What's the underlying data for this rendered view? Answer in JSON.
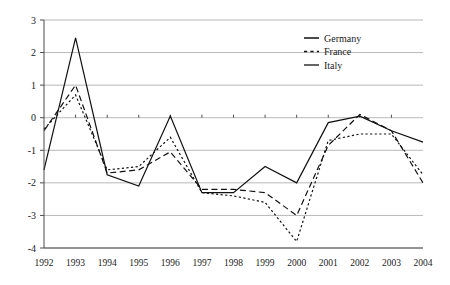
{
  "chart_data": {
    "type": "line",
    "title": "",
    "subtitle": "",
    "xlabel": "",
    "ylabel": "",
    "categories": [
      "1992",
      "1993",
      "1994",
      "1995",
      "1996",
      "1997",
      "1998",
      "1999",
      "2000",
      "2001",
      "2002",
      "2003",
      "2004"
    ],
    "x": [
      1992,
      1993,
      1994,
      1995,
      1996,
      1997,
      1998,
      1999,
      2000,
      2001,
      2002,
      2003,
      2004
    ],
    "xlim": [
      1992,
      2004
    ],
    "ylim": [
      -4,
      3
    ],
    "yticks": [
      3,
      2,
      1,
      0,
      -1,
      -2,
      -3,
      -4
    ],
    "ytick_labels": [
      "3",
      "2",
      "1",
      "0",
      "-1",
      "-2",
      "-3",
      "-4"
    ],
    "grid": true,
    "grid_axis": "y",
    "legend_position": "top-right",
    "series": [
      {
        "name": "Germany",
        "style": "dashed",
        "color": "#111111",
        "values": [
          -0.4,
          1.0,
          -1.7,
          -1.6,
          -1.05,
          -2.2,
          -2.2,
          -2.3,
          -3.0,
          -0.85,
          0.1,
          -0.4,
          -2.0
        ]
      },
      {
        "name": "France",
        "style": "dotted",
        "color": "#111111",
        "values": [
          -0.35,
          0.7,
          -1.6,
          -1.5,
          -0.6,
          -2.3,
          -2.4,
          -2.6,
          -3.8,
          -0.7,
          -0.5,
          -0.5,
          -1.75
        ]
      },
      {
        "name": "Italy",
        "style": "solid",
        "color": "#111111",
        "values": [
          -1.6,
          2.45,
          -1.75,
          -2.1,
          0.05,
          -2.3,
          -2.3,
          -1.5,
          -2.0,
          -0.15,
          0.05,
          -0.4,
          -0.75
        ]
      }
    ]
  },
  "legend": {
    "entries": [
      {
        "label": "Germany",
        "style": "dashed"
      },
      {
        "label": "France",
        "style": "dotted"
      },
      {
        "label": "Italy",
        "style": "solid"
      }
    ]
  },
  "axes": {
    "y_tick_labels": [
      "3",
      "2",
      "1",
      "0",
      "-1",
      "-2",
      "-3",
      "-4"
    ],
    "x_tick_labels": [
      "1992",
      "1993",
      "1994",
      "1995",
      "1996",
      "1997",
      "1998",
      "1999",
      "2000",
      "2001",
      "2002",
      "2003",
      "2004"
    ]
  },
  "colors": {
    "plot_line": "#111111",
    "gridline": "#9a9a9a",
    "axis": "#4d4d4d",
    "background": "#ffffff",
    "text": "#1a1a1a"
  }
}
